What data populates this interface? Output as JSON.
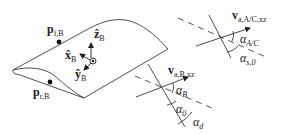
{
  "figure": {
    "type": "wing-geometry-diagram",
    "stroke_color": "#222222",
    "background": "#ffffff"
  },
  "labels": {
    "p_front": {
      "base": "p",
      "sub": "f,B"
    },
    "p_rear": {
      "base": "p",
      "sub": "r,B"
    },
    "x_body": {
      "base": "x̂",
      "sub": "B"
    },
    "y_body": {
      "base": "ŷ",
      "sub": "B"
    },
    "z_body": {
      "base": "ẑ",
      "sub": "B"
    },
    "v_wing_B": {
      "base": "v",
      "sub": "a,B,xz"
    },
    "alpha_B": {
      "base": "α",
      "sub": "B"
    },
    "alpha_0": {
      "base": "α",
      "sub": "0"
    },
    "alpha_d": {
      "base": "α",
      "sub": "d"
    },
    "v_wing_AC": {
      "base": "v",
      "sub": "a,A/C,xz"
    },
    "alpha_AC": {
      "base": "α",
      "sub": "A/C"
    },
    "alpha_s0": {
      "base": "α",
      "sub": "s,0"
    }
  }
}
